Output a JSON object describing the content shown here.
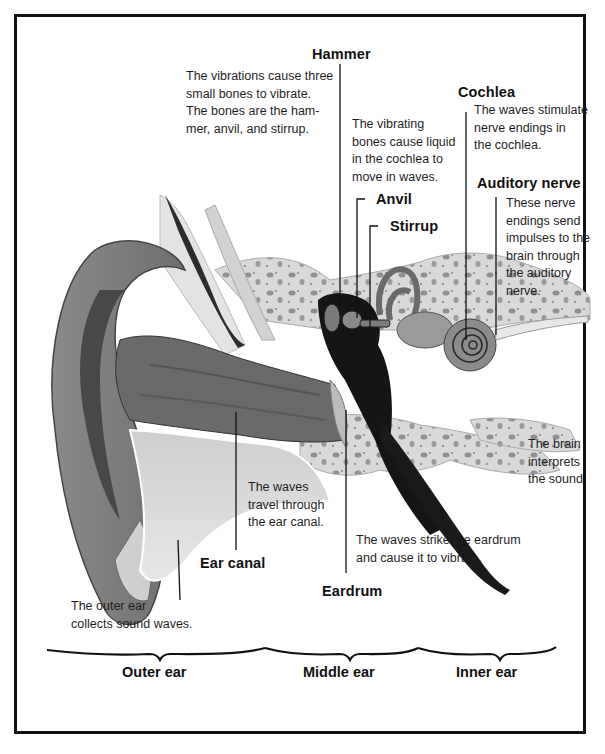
{
  "diagram": {
    "labels": {
      "hammer": "Hammer",
      "anvil": "Anvil",
      "stirrup": "Stirrup",
      "cochlea": "Cochlea",
      "auditory_nerve": "Auditory nerve",
      "ear_canal": "Ear canal",
      "eardrum": "Eardrum"
    },
    "captions": {
      "bones": [
        "The vibrations cause three",
        "small bones to vibrate.",
        "The bones are the ham-",
        "mer, anvil, and stirrup."
      ],
      "liquid": [
        "The vibrating",
        "bones cause liquid",
        "in the cochlea to",
        "move in waves."
      ],
      "cochlea": [
        "The waves stimulate",
        "nerve endings in",
        "the cochlea."
      ],
      "nerve": [
        "These nerve",
        "endings send",
        "impulses to the",
        "brain through",
        "the auditory",
        "nerve."
      ],
      "brain": [
        "The brain",
        "interprets",
        "the sound."
      ],
      "canal": [
        "The waves",
        "travel through",
        "the ear canal."
      ],
      "eardrum": [
        "The waves strike the eardrum",
        "and cause it to vibrate."
      ],
      "outer": [
        "The outer ear",
        "collects sound waves."
      ]
    },
    "sections": {
      "outer": "Outer ear",
      "middle": "Middle ear",
      "inner": "Inner ear"
    }
  }
}
